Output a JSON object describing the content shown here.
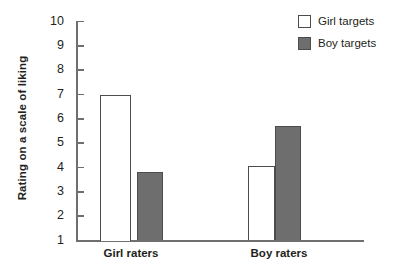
{
  "chart_data": {
    "type": "bar",
    "title": "",
    "xlabel": "",
    "ylabel": "Rating on a scale of liking",
    "categories": [
      "Girl raters",
      "Boy raters"
    ],
    "series": [
      {
        "name": "Girl targets",
        "fill": "open",
        "color": "#ffffff",
        "values": [
          7.0,
          4.05
        ]
      },
      {
        "name": "Boy targets",
        "fill": "filled",
        "color": "#6e6e6e",
        "values": [
          3.8,
          5.7
        ]
      }
    ],
    "ylim": [
      1,
      10
    ],
    "yticks": [
      10,
      9,
      8,
      7,
      6,
      5,
      4,
      3,
      2,
      1
    ],
    "ytick_labels": [
      "10",
      "9",
      "8",
      "7",
      "6",
      "5",
      "4",
      "3",
      "2",
      "1"
    ],
    "grid": false,
    "legend_position": "top-right"
  },
  "axis": {
    "y_title": "Rating on a scale of liking",
    "ticks": [
      {
        "label": "10",
        "value": 10
      },
      {
        "label": "9",
        "value": 9
      },
      {
        "label": "8",
        "value": 8
      },
      {
        "label": "7",
        "value": 7
      },
      {
        "label": "6",
        "value": 6
      },
      {
        "label": "5",
        "value": 5
      },
      {
        "label": "4",
        "value": 4
      },
      {
        "label": "3",
        "value": 3
      },
      {
        "label": "2",
        "value": 2
      },
      {
        "label": "1",
        "value": 1
      }
    ]
  },
  "categories": [
    {
      "label": "Girl raters"
    },
    {
      "label": "Boy raters"
    }
  ],
  "legend": {
    "items": [
      {
        "label": "Girl targets",
        "swatch": "open"
      },
      {
        "label": "Boy targets",
        "swatch": "filled"
      }
    ]
  },
  "colors": {
    "bar_fill_gray": "#6e6e6e",
    "bar_fill_white": "#ffffff",
    "bar_stroke": "#4c4c4c",
    "axis": "#6f6f6f",
    "text": "#231f20"
  }
}
